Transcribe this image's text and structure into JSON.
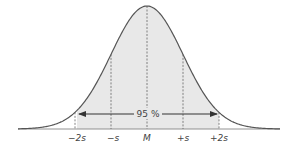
{
  "diagram": {
    "interval_label": "95 %",
    "axis_labels": [
      "−2s",
      "−s",
      "M",
      "+s",
      "+2s"
    ],
    "colors": {
      "curve": "#555555",
      "fill": "#e6e6e6",
      "dash": "#666666",
      "arrow": "#333333",
      "baseline": "#777777"
    }
  },
  "chart_data": {
    "type": "area",
    "title": "",
    "xlabel": "",
    "ylabel": "",
    "x_ticks": [
      "−2s",
      "−s",
      "M",
      "+s",
      "+2s"
    ],
    "x_positions_sd": [
      -2,
      -1,
      0,
      1,
      2
    ],
    "shaded_range_sd": [
      -2,
      2
    ],
    "annotation": "95 %",
    "grid": false
  }
}
